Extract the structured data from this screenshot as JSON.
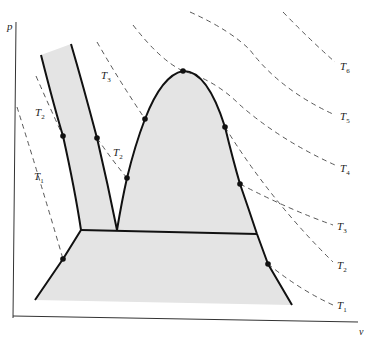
{
  "diagram": {
    "type": "p-v phase diagram",
    "axes": {
      "y_label": "p",
      "x_label": "v"
    },
    "isotherms": [
      {
        "id": "T1-left",
        "label": "T",
        "sub": "1"
      },
      {
        "id": "T2-left",
        "label": "T",
        "sub": "2"
      },
      {
        "id": "T3-top",
        "label": "T",
        "sub": "3"
      },
      {
        "id": "T2-mid",
        "label": "T",
        "sub": "2"
      },
      {
        "id": "T6",
        "label": "T",
        "sub": "6"
      },
      {
        "id": "T5",
        "label": "T",
        "sub": "5"
      },
      {
        "id": "T4",
        "label": "T",
        "sub": "4"
      },
      {
        "id": "T3",
        "label": "T",
        "sub": "3"
      },
      {
        "id": "T2",
        "label": "T",
        "sub": "2"
      },
      {
        "id": "T1",
        "label": "T",
        "sub": "1"
      }
    ],
    "regions": [
      "solid-liquid band",
      "liquid-vapor dome",
      "solid-vapor region"
    ],
    "colors": {
      "shade": "#e4e4e4",
      "boundary": "#111111",
      "isotherm": "#444444"
    }
  }
}
